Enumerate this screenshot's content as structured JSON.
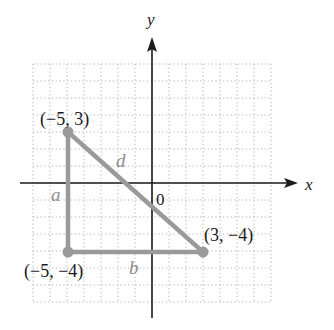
{
  "diagram": {
    "type": "coordinate-plane-right-triangle",
    "axes": {
      "x_label": "x",
      "y_label": "y",
      "origin_label": "0",
      "grid_range": {
        "x": [
          -7,
          7
        ],
        "y": [
          -7,
          7
        ]
      }
    },
    "points": [
      {
        "label": "(−5, 3)",
        "x": -5,
        "y": 3
      },
      {
        "label": "(−5, −4)",
        "x": -5,
        "y": -4
      },
      {
        "label": "(3, −4)",
        "x": 3,
        "y": -4
      }
    ],
    "sides": [
      {
        "label": "a",
        "from": 0,
        "to": 1
      },
      {
        "label": "b",
        "from": 1,
        "to": 2
      },
      {
        "label": "d",
        "from": 0,
        "to": 2
      }
    ],
    "colors": {
      "axis": "#1a1a1a",
      "grid": "#b0b0b0",
      "triangle": "#9a9a9a",
      "side_label": "#8c8c8c"
    }
  }
}
